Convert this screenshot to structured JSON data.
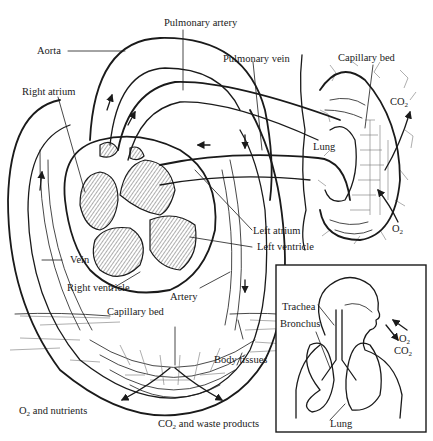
{
  "diagram": {
    "type": "circulatory-respiratory-schematic",
    "labels": {
      "pulmonary_artery": "Pulmonary artery",
      "aorta": "Aorta",
      "pulmonary_vein": "Pulmonary vein",
      "capillary_bed_lung": "Capillary bed",
      "right_atrium": "Right atrium",
      "co2_lung": "CO",
      "co2_lung_sub": "2",
      "lung_main": "Lung",
      "o2_lung": "O",
      "o2_lung_sub": "2",
      "left_atrium": "Left atrium",
      "left_ventricle": "Left ventricle",
      "vein": "Vein",
      "right_ventricle": "Right ventricle",
      "artery": "Artery",
      "capillary_bed_body": "Capillary bed",
      "body_tissues": "Body tissues",
      "o2_nutrients_prefix": "O",
      "o2_nutrients_sub": "2",
      "o2_nutrients_rest": " and nutrients",
      "co2_waste_prefix": "CO",
      "co2_waste_sub": "2",
      "co2_waste_rest": " and waste products"
    },
    "inset": {
      "trachea": "Trachea",
      "bronchus": "Bronchus",
      "lung": "Lung",
      "o2": "O",
      "o2_sub": "2",
      "co2": "CO",
      "co2_sub": "2"
    },
    "colors": {
      "ink": "#1a1a1a",
      "background": "#ffffff"
    }
  }
}
